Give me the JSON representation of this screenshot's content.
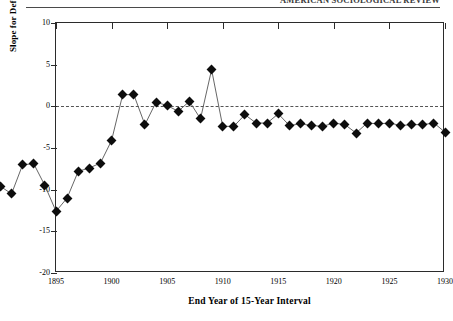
{
  "running_head": {
    "text": "AMERICAN SOCIOLOGICAL REVIEW"
  },
  "chart_data": {
    "type": "line",
    "title": "",
    "subtitle": "",
    "xlabel": "End Year of 15-Year Interval",
    "ylabel": "Slope for Deflated Price of Cotton",
    "xlim": [
      1895,
      1930
    ],
    "ylim": [
      -20,
      10
    ],
    "xticks": [
      1895,
      1900,
      1905,
      1910,
      1915,
      1920,
      1925,
      1930
    ],
    "yticks": [
      10,
      5,
      0,
      -5,
      -10,
      -15,
      -20
    ],
    "grid": false,
    "legend": "none",
    "reference_line": {
      "y": 0,
      "style": "dashed",
      "color": "#555555"
    },
    "series": [
      {
        "name": "Slope for Deflated Price of Cotton",
        "marker": "filled-diamond",
        "line_color": "#555555",
        "marker_color": "#0d0d0d",
        "x": [
          1887,
          1888,
          1889,
          1890,
          1891,
          1892,
          1893,
          1894,
          1895,
          1896,
          1897,
          1898,
          1899,
          1900,
          1901,
          1902,
          1903,
          1904,
          1905,
          1906,
          1907,
          1908,
          1909,
          1910,
          1911,
          1912,
          1913,
          1914,
          1915,
          1916,
          1917,
          1918,
          1919,
          1920,
          1921,
          1922,
          1923,
          1924,
          1925,
          1926,
          1927,
          1928,
          1929,
          1930
        ],
        "y": [
          -11.2,
          -10.0,
          -8.8,
          -9.6,
          -10.5,
          -7.0,
          -6.9,
          -9.5,
          -12.6,
          -11.0,
          -7.8,
          -7.4,
          -6.8,
          -4.1,
          1.4,
          1.4,
          -2.2,
          0.5,
          0.1,
          -0.6,
          0.6,
          -1.5,
          4.4,
          -2.4,
          -2.4,
          -1.0,
          -2.0,
          -2.0,
          -0.9,
          -2.3,
          -2.1,
          -2.3,
          -2.4,
          -2.0,
          -2.2,
          -3.2,
          -2.0,
          -2.1,
          -2.0,
          -2.3,
          -2.2,
          -2.2,
          -2.0,
          -3.1
        ]
      }
    ]
  },
  "axis_text": {
    "y_labels": [
      "10",
      "5",
      "0",
      "-5",
      "-10",
      "-15",
      "-20"
    ],
    "x_labels": [
      "1895",
      "1900",
      "1905",
      "1910",
      "1915",
      "1920",
      "1925",
      "1930"
    ]
  }
}
